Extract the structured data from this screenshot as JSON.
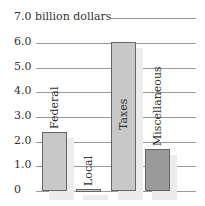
{
  "chart_data": {
    "type": "bar",
    "title": "",
    "ylabel": "billion dollars",
    "xlabel": "",
    "categories": [
      "Federal",
      "Local",
      "Taxes",
      "Miscellaneous"
    ],
    "values": [
      2.4,
      0.1,
      6.05,
      1.7
    ],
    "colors": [
      "#c8c8c8",
      "#c8c8c8",
      "#c8c8c8",
      "#9a9a9a"
    ],
    "ylim": [
      0,
      7.0
    ],
    "yticks": [
      "0",
      "1.0",
      "2.0",
      "3.0",
      "4.0",
      "5.0",
      "6.0",
      "7.0"
    ],
    "top_label": "7.0 billion dollars",
    "grid": true,
    "legend": "none",
    "bar_labels_rotated": true
  }
}
